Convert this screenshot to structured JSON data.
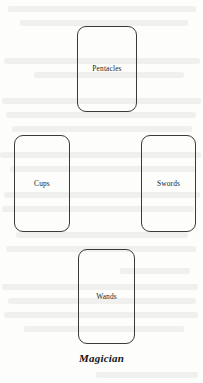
{
  "page": {
    "background_color": "#fdfdfc",
    "ink_color": "#1d1d1d",
    "card_border_color": "#3a3a3a"
  },
  "spread": {
    "caption": "Magician",
    "cards": [
      {
        "id": "pentacles",
        "label": "Pentacles",
        "position": "top"
      },
      {
        "id": "cups",
        "label": "Cups",
        "position": "left"
      },
      {
        "id": "swords",
        "label": "Swords",
        "position": "right"
      },
      {
        "id": "wands",
        "label": "Wands",
        "position": "bottom"
      }
    ]
  },
  "ghosting": {
    "description": "faint illegible bleed-through text from reverse side of page",
    "lines": [
      {
        "x": 8,
        "y": 6,
        "w": 188
      },
      {
        "x": 20,
        "y": 20,
        "w": 168
      },
      {
        "x": 4,
        "y": 58,
        "w": 196
      },
      {
        "x": 34,
        "y": 72,
        "w": 150
      },
      {
        "x": 2,
        "y": 98,
        "w": 199
      },
      {
        "x": 6,
        "y": 112,
        "w": 190
      },
      {
        "x": 12,
        "y": 126,
        "w": 180
      },
      {
        "x": 0,
        "y": 152,
        "w": 201
      },
      {
        "x": 10,
        "y": 166,
        "w": 186
      },
      {
        "x": 4,
        "y": 192,
        "w": 196
      },
      {
        "x": 2,
        "y": 206,
        "w": 192
      },
      {
        "x": 16,
        "y": 232,
        "w": 172
      },
      {
        "x": 6,
        "y": 246,
        "w": 190
      },
      {
        "x": 120,
        "y": 268,
        "w": 70
      },
      {
        "x": 2,
        "y": 284,
        "w": 196
      },
      {
        "x": 8,
        "y": 298,
        "w": 188
      },
      {
        "x": 4,
        "y": 312,
        "w": 194
      },
      {
        "x": 24,
        "y": 326,
        "w": 160
      },
      {
        "x": 96,
        "y": 372,
        "w": 102
      }
    ]
  }
}
